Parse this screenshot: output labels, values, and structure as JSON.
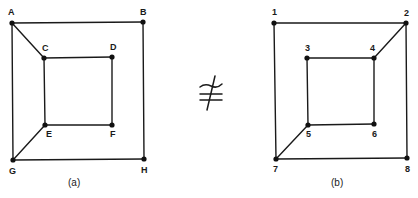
{
  "figure": {
    "relation_symbol": "≇",
    "relation_meaning": "not isomorphic",
    "graphs": [
      {
        "id": "a",
        "caption": "(a)",
        "caption_pos": [
          68,
          186
        ],
        "vertices": [
          {
            "label": "A",
            "x": 12,
            "y": 23,
            "lx": 8,
            "ly": 15
          },
          {
            "label": "B",
            "x": 143,
            "y": 22,
            "lx": 140,
            "ly": 15
          },
          {
            "label": "C",
            "x": 44,
            "y": 58,
            "lx": 42,
            "ly": 51
          },
          {
            "label": "D",
            "x": 112,
            "y": 57,
            "lx": 110,
            "ly": 50
          },
          {
            "label": "E",
            "x": 45,
            "y": 125,
            "lx": 46,
            "ly": 137
          },
          {
            "label": "F",
            "x": 112,
            "y": 125,
            "lx": 110,
            "ly": 137
          },
          {
            "label": "G",
            "x": 13,
            "y": 160,
            "lx": 9,
            "ly": 174
          },
          {
            "label": "H",
            "x": 144,
            "y": 159,
            "lx": 141,
            "ly": 173
          }
        ],
        "edges": [
          [
            "A",
            "B"
          ],
          [
            "B",
            "H"
          ],
          [
            "H",
            "G"
          ],
          [
            "G",
            "A"
          ],
          [
            "C",
            "D"
          ],
          [
            "D",
            "F"
          ],
          [
            "F",
            "E"
          ],
          [
            "E",
            "C"
          ],
          [
            "A",
            "C"
          ],
          [
            "G",
            "E"
          ]
        ]
      },
      {
        "id": "b",
        "caption": "(b)",
        "caption_pos": [
          331,
          186
        ],
        "vertices": [
          {
            "label": "1",
            "x": 274,
            "y": 23,
            "lx": 272,
            "ly": 15
          },
          {
            "label": "2",
            "x": 406,
            "y": 23,
            "lx": 404,
            "ly": 16
          },
          {
            "label": "3",
            "x": 307,
            "y": 58,
            "lx": 305,
            "ly": 51
          },
          {
            "label": "4",
            "x": 374,
            "y": 58,
            "lx": 370,
            "ly": 51
          },
          {
            "label": "5",
            "x": 308,
            "y": 125,
            "lx": 306,
            "ly": 137
          },
          {
            "label": "6",
            "x": 374,
            "y": 124,
            "lx": 372,
            "ly": 137
          },
          {
            "label": "7",
            "x": 276,
            "y": 159,
            "lx": 273,
            "ly": 172
          },
          {
            "label": "8",
            "x": 407,
            "y": 158,
            "lx": 405,
            "ly": 172
          }
        ],
        "edges": [
          [
            "1",
            "2"
          ],
          [
            "2",
            "8"
          ],
          [
            "8",
            "7"
          ],
          [
            "7",
            "1"
          ],
          [
            "3",
            "4"
          ],
          [
            "4",
            "6"
          ],
          [
            "6",
            "5"
          ],
          [
            "5",
            "3"
          ],
          [
            "2",
            "4"
          ],
          [
            "7",
            "5"
          ]
        ]
      }
    ]
  }
}
